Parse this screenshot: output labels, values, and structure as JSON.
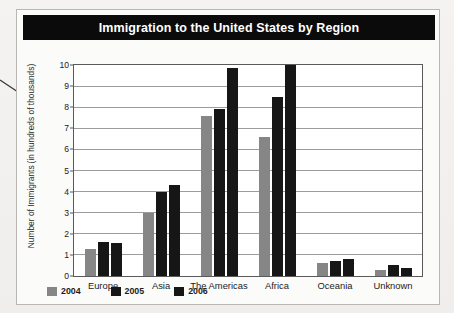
{
  "card": {
    "title": "Immigration to the United States by Region"
  },
  "annotation": {
    "leader_line_name": "callout-leader-line"
  },
  "colors": {
    "banner_bg": "#0b0b0b",
    "banner_text": "#ffffff",
    "bar_2004": "#868686",
    "bar_2005": "#161616",
    "bar_2006": "#161616",
    "gridline": "#9c9c9c",
    "plot_border": "#5a5a5a",
    "page_bg": "#f2f1ef",
    "card_bg": "#fbfbfa"
  },
  "chart_data": {
    "type": "bar",
    "title": "Immigration to the United States by Region",
    "xlabel": "",
    "ylabel": "Number of Immigrants (in hundreds of thousands)",
    "ylabel_line1": "Number of Immigrants",
    "ylabel_line2": "(in hundreds of thousands)",
    "ylim": [
      0,
      10
    ],
    "yticks": [
      0,
      1,
      2,
      3,
      4,
      5,
      6,
      7,
      8,
      9,
      10
    ],
    "ytick_labels": [
      "0",
      "1",
      "2",
      "3",
      "4",
      "5",
      "6",
      "7",
      "8",
      "9",
      "10"
    ],
    "grid": true,
    "legend_position": "bottom-left",
    "categories": [
      "Europe",
      "Asia",
      "The Americas",
      "Africa",
      "Oceania",
      "Unknown"
    ],
    "series": [
      {
        "name": "2004",
        "color": "#868686",
        "values": [
          1.3,
          3.0,
          7.6,
          6.6,
          0.6,
          0.3
        ]
      },
      {
        "name": "2005",
        "color": "#161616",
        "values": [
          1.6,
          4.0,
          7.9,
          8.5,
          0.7,
          0.5
        ]
      },
      {
        "name": "2006",
        "color": "#161616",
        "values": [
          1.55,
          4.3,
          9.85,
          10.0,
          0.8,
          0.4
        ]
      }
    ]
  }
}
